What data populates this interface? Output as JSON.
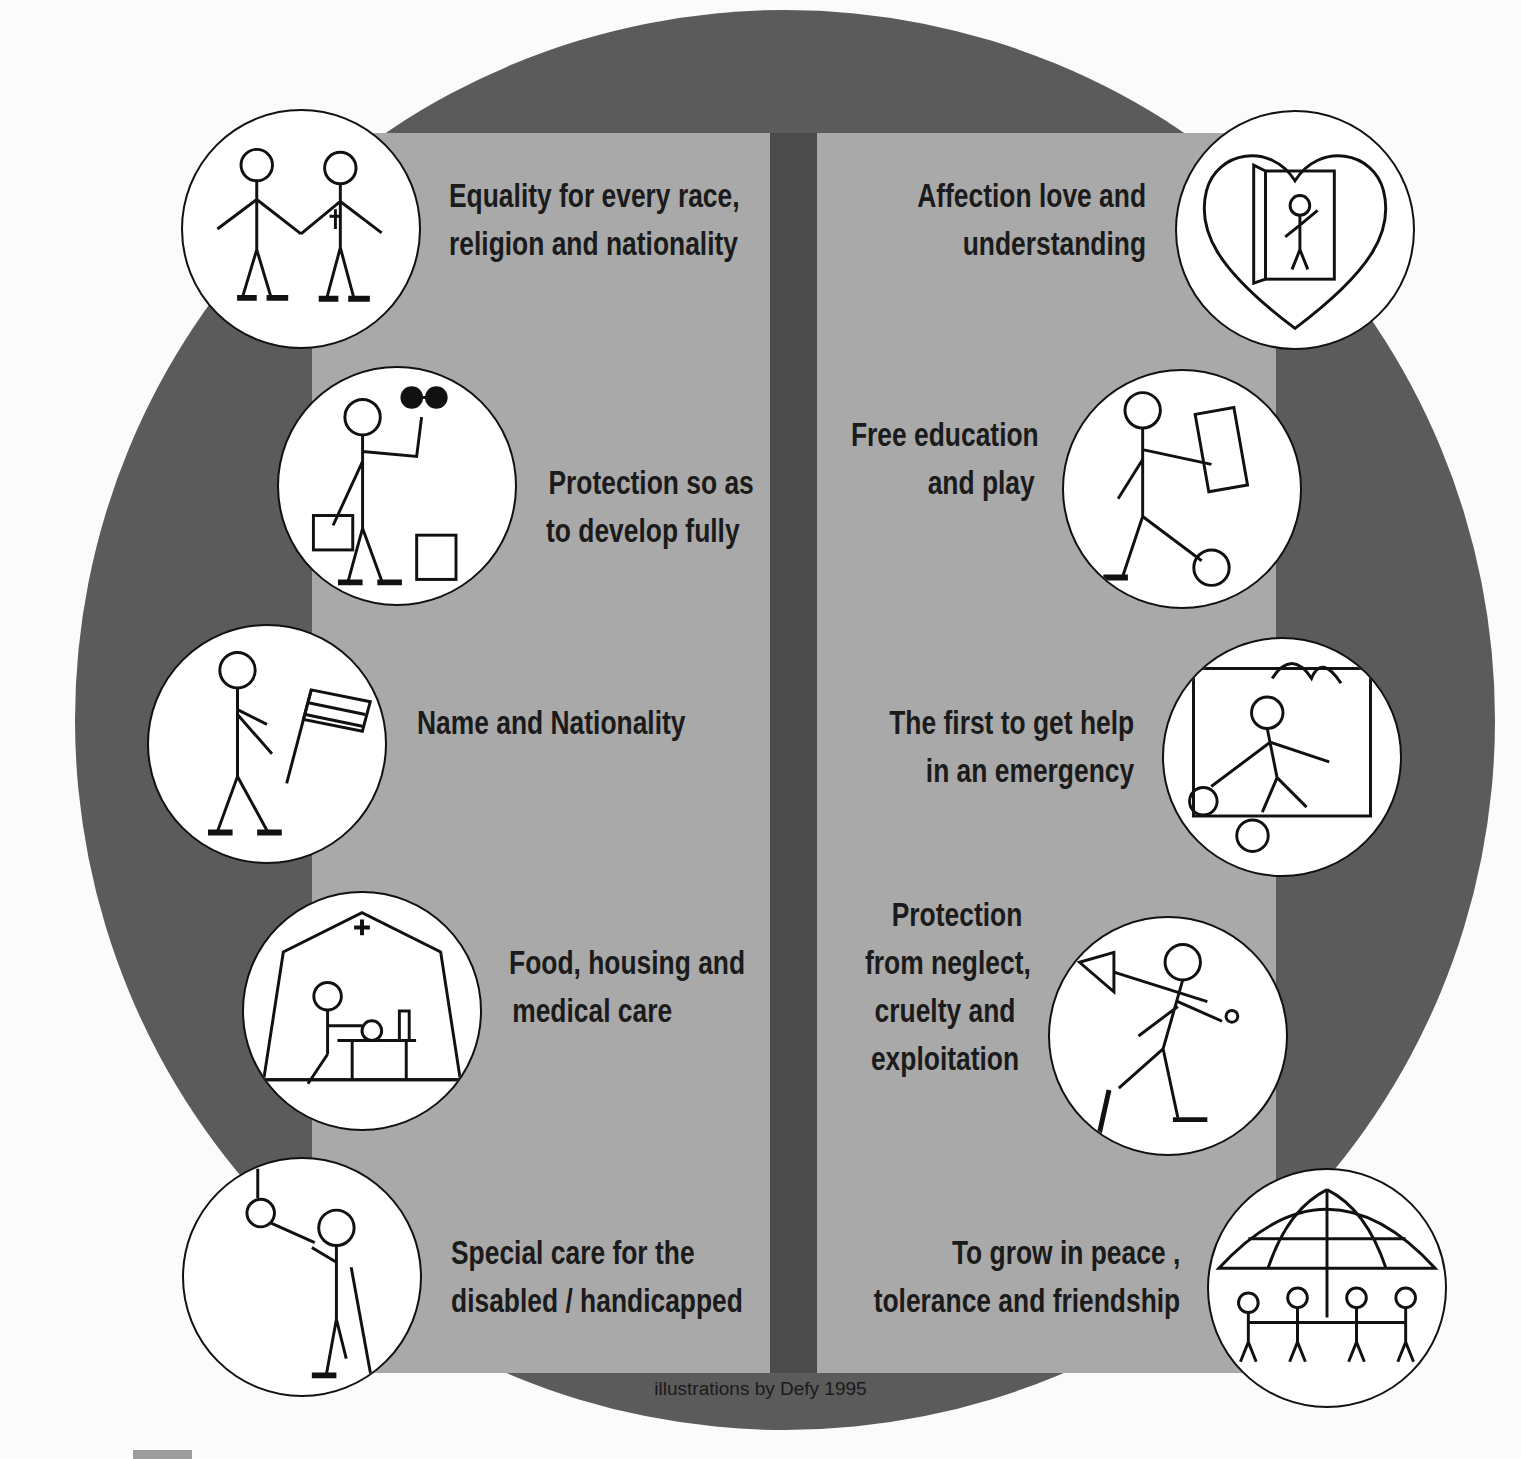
{
  "title": "The Ten Basic Rights of the Child",
  "colors": {
    "background": "#fbfbfb",
    "circle": "#5b5b5b",
    "panel": "#a9a9a9",
    "divider": "#4b4b4b",
    "text": "#1b1b1b"
  },
  "rights_left": [
    {
      "lines": [
        "Equality for every race,",
        "religion and nationality"
      ],
      "icon": "children-holding-hands-icon"
    },
    {
      "lines": [
        "Protection so as",
        "to develop fully"
      ],
      "icon": "child-with-dumbbell-icon"
    },
    {
      "lines": [
        "Name and Nationality"
      ],
      "icon": "child-with-flag-icon"
    },
    {
      "lines": [
        "Food, housing and",
        "medical care"
      ],
      "icon": "child-eating-in-tent-icon"
    },
    {
      "lines": [
        "Special care for the",
        "disabled / handicapped"
      ],
      "icon": "child-on-crutches-icon"
    }
  ],
  "rights_right": [
    {
      "lines": [
        "Affection love and",
        "understanding"
      ],
      "icon": "heart-with-child-icon"
    },
    {
      "lines": [
        "Free education",
        "and play"
      ],
      "icon": "child-with-book-and-ball-icon"
    },
    {
      "lines": [
        "The first to get help",
        "in an emergency"
      ],
      "icon": "child-rescued-from-fire-icon"
    },
    {
      "lines": [
        "Protection",
        "from neglect,",
        "cruelty and",
        "exploitation"
      ],
      "icon": "child-with-shovel-icon"
    },
    {
      "lines": [
        "To grow in peace ,",
        "tolerance and friendship"
      ],
      "icon": "children-under-globe-umbrella-icon"
    }
  ],
  "credit": "illustrations by Defy 1995"
}
